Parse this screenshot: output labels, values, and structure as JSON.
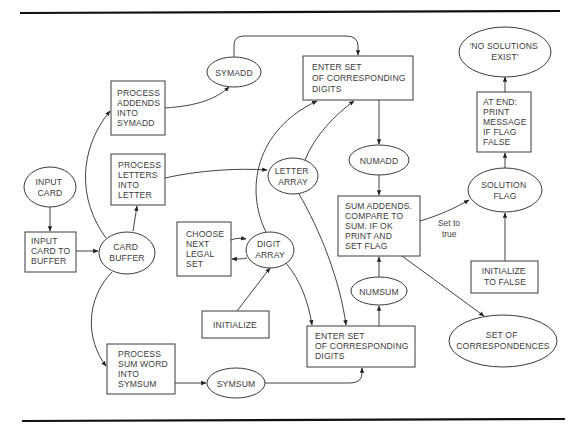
{
  "diagram": {
    "type": "data-flow diagram",
    "nodes": [
      {
        "id": "input-card",
        "shape": "ellipse",
        "lines": [
          "INPUT",
          "CARD"
        ]
      },
      {
        "id": "input-card-to-buffer",
        "shape": "box",
        "lines": [
          "INPUT",
          "CARD TO",
          "BUFFER"
        ]
      },
      {
        "id": "card-buffer",
        "shape": "ellipse",
        "lines": [
          "CARD",
          "BUFFER"
        ]
      },
      {
        "id": "process-addends",
        "shape": "box",
        "lines": [
          "PROCESS",
          "ADDENDS",
          "INTO",
          "SYMADD"
        ]
      },
      {
        "id": "symadd",
        "shape": "ellipse",
        "lines": [
          "SYMADD"
        ]
      },
      {
        "id": "process-letters",
        "shape": "box",
        "lines": [
          "PROCESS",
          "LETTERS",
          "INTO",
          "LETTER"
        ]
      },
      {
        "id": "letter-array",
        "shape": "ellipse",
        "lines": [
          "LETTER",
          "ARRAY"
        ]
      },
      {
        "id": "choose-next-legal-set",
        "shape": "box",
        "lines": [
          "CHOOSE",
          "NEXT",
          "LEGAL",
          "SET"
        ]
      },
      {
        "id": "digit-array",
        "shape": "ellipse",
        "lines": [
          "DIGIT",
          "ARRAY"
        ]
      },
      {
        "id": "initialize",
        "shape": "box",
        "lines": [
          "INITIALIZE"
        ]
      },
      {
        "id": "process-sum-word",
        "shape": "box",
        "lines": [
          "PROCESS",
          "SUM WORD",
          "INTO",
          "SYMSUM"
        ]
      },
      {
        "id": "symsum",
        "shape": "ellipse",
        "lines": [
          "SYMSUM"
        ]
      },
      {
        "id": "enter-set-top",
        "shape": "box",
        "lines": [
          "ENTER SET",
          "OF CORRESPONDING",
          "DIGITS"
        ]
      },
      {
        "id": "numadd",
        "shape": "ellipse",
        "lines": [
          "NUMADD"
        ]
      },
      {
        "id": "sum-addends",
        "shape": "box",
        "lines": [
          "SUM ADDENDS.",
          "COMPARE TO",
          "SUM. IF OK",
          "PRINT AND",
          "SET FLAG"
        ]
      },
      {
        "id": "numsum",
        "shape": "ellipse",
        "lines": [
          "NUMSUM"
        ]
      },
      {
        "id": "enter-set-bottom",
        "shape": "box",
        "lines": [
          "ENTER SET",
          "OF CORRESPONDING",
          "DIGITS"
        ]
      },
      {
        "id": "no-solutions-exist",
        "shape": "ellipse",
        "lines": [
          "'NO SOLUTIONS",
          "EXIST'"
        ]
      },
      {
        "id": "at-end-print",
        "shape": "box",
        "lines": [
          "AT END:",
          "PRINT",
          "MESSAGE",
          "IF FLAG",
          "FALSE"
        ]
      },
      {
        "id": "solution-flag",
        "shape": "ellipse",
        "lines": [
          "SOLUTION",
          "FLAG"
        ]
      },
      {
        "id": "initialize-to-false",
        "shape": "box",
        "lines": [
          "INITIALIZE",
          "TO FALSE"
        ]
      },
      {
        "id": "set-of-correspondences",
        "shape": "ellipse",
        "lines": [
          "SET OF",
          "CORRESPONDENCES"
        ]
      }
    ],
    "edges": [
      {
        "from": "input-card",
        "to": "input-card-to-buffer",
        "label": ""
      },
      {
        "from": "input-card-to-buffer",
        "to": "card-buffer",
        "label": ""
      },
      {
        "from": "card-buffer",
        "to": "process-addends",
        "label": ""
      },
      {
        "from": "card-buffer",
        "to": "process-letters",
        "label": ""
      },
      {
        "from": "card-buffer",
        "to": "process-sum-word",
        "label": ""
      },
      {
        "from": "process-addends",
        "to": "symadd",
        "label": ""
      },
      {
        "from": "symadd",
        "to": "enter-set-top",
        "label": ""
      },
      {
        "from": "process-letters",
        "to": "letter-array",
        "label": ""
      },
      {
        "from": "choose-next-legal-set",
        "to": "digit-array",
        "label": ""
      },
      {
        "from": "digit-array",
        "to": "choose-next-legal-set",
        "label": ""
      },
      {
        "from": "initialize",
        "to": "digit-array",
        "label": ""
      },
      {
        "from": "digit-array",
        "to": "enter-set-top",
        "label": ""
      },
      {
        "from": "letter-array",
        "to": "enter-set-top",
        "label": ""
      },
      {
        "from": "letter-array",
        "to": "enter-set-bottom",
        "label": ""
      },
      {
        "from": "digit-array",
        "to": "enter-set-bottom",
        "label": ""
      },
      {
        "from": "process-sum-word",
        "to": "symsum",
        "label": ""
      },
      {
        "from": "symsum",
        "to": "enter-set-bottom",
        "label": ""
      },
      {
        "from": "enter-set-top",
        "to": "numadd",
        "label": ""
      },
      {
        "from": "numadd",
        "to": "sum-addends",
        "label": ""
      },
      {
        "from": "enter-set-bottom",
        "to": "numsum",
        "label": ""
      },
      {
        "from": "numsum",
        "to": "sum-addends",
        "label": ""
      },
      {
        "from": "sum-addends",
        "to": "solution-flag",
        "label": "Set to true",
        "label_lines": [
          "Set to",
          "true"
        ]
      },
      {
        "from": "sum-addends",
        "to": "set-of-correspondences",
        "label": ""
      },
      {
        "from": "initialize-to-false",
        "to": "solution-flag",
        "label": ""
      },
      {
        "from": "solution-flag",
        "to": "at-end-print",
        "label": ""
      },
      {
        "from": "at-end-print",
        "to": "no-solutions-exist",
        "label": ""
      }
    ]
  }
}
